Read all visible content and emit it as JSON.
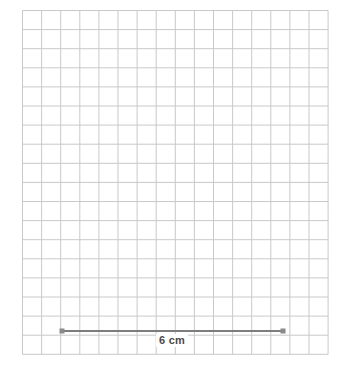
{
  "canvas": {
    "width": 340,
    "height": 371,
    "background": "#ffffff"
  },
  "grid": {
    "cell_size": 19.1,
    "line_color": "#c9c9c9",
    "line_width": 1,
    "origin_x": 22.5,
    "origin_y": 10.5,
    "columns": 16,
    "rows": 18,
    "label": "square-grid"
  },
  "chart_data": {
    "type": "diagram",
    "title": "",
    "subtitle": "",
    "grid": {
      "on": true,
      "cell_size_px": 19.1,
      "columns": 16,
      "rows": 18
    },
    "shapes": [
      {
        "name": "line-segment",
        "type": "segment",
        "x1": 62,
        "y1": 331,
        "x2": 283,
        "y2": 331,
        "length_px": 221,
        "length_cells": 11.6,
        "color": "#7d7d7d",
        "stroke_width": 1.8,
        "endpoints": [
          {
            "name": "left-endpoint",
            "x": 62,
            "y": 331,
            "marker": "square",
            "size": 5,
            "color": "#8a8a8a"
          },
          {
            "name": "right-endpoint",
            "x": 283,
            "y": 331,
            "marker": "square",
            "size": 5,
            "color": "#8a8a8a"
          }
        ]
      }
    ],
    "annotations": [
      {
        "name": "length-label",
        "text": "6 cm",
        "x": 172,
        "y": 334,
        "color": "#4a4a4a",
        "font_size": 11,
        "bold": true,
        "value": 6,
        "unit": "cm"
      }
    ]
  },
  "figure": {
    "segment": {
      "x1": 62,
      "y1": 331,
      "x2": 283,
      "y2": 331,
      "color": "#7d7d7d",
      "stroke_width": 1.8
    },
    "endpoint_left": {
      "x": 62,
      "y": 331,
      "size": 5,
      "color": "#8a8a8a"
    },
    "endpoint_right": {
      "x": 283,
      "y": 331,
      "size": 5,
      "color": "#8a8a8a"
    },
    "length_label": {
      "text": "6 cm",
      "x": 172,
      "y": 334
    }
  }
}
